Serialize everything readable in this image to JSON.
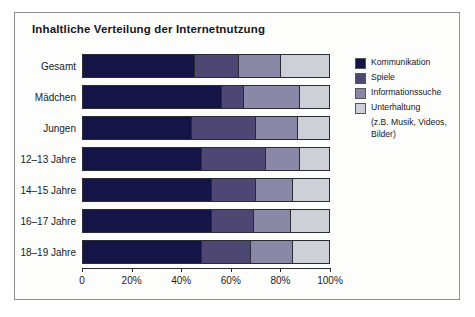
{
  "title": "Inhaltliche Verteilung der Internetnutzung",
  "legend": {
    "items": [
      {
        "label": "Kommunikation",
        "color": "#141446"
      },
      {
        "label": "Spiele",
        "color": "#4e4673"
      },
      {
        "label": "Informationssuche",
        "color": "#8a88a6"
      },
      {
        "label": "Unterhaltung",
        "color": "#cfcfd8"
      }
    ],
    "sublines": [
      "(z.B. Musik, Videos,",
      "Bilder)"
    ]
  },
  "axis": {
    "ticks": [
      "0",
      "20%",
      "40%",
      "60%",
      "80%",
      "100%"
    ],
    "tick_values": [
      0,
      20,
      40,
      60,
      80,
      100
    ]
  },
  "chart_data": {
    "type": "bar",
    "orientation": "horizontal",
    "stacked": true,
    "title": "Inhaltliche Verteilung der Internetnutzung",
    "xlabel": "",
    "ylabel": "",
    "xlim": [
      0,
      100
    ],
    "grid": false,
    "legend_position": "right",
    "categories": [
      "Gesamt",
      "Mädchen",
      "Jungen",
      "12–13 Jahre",
      "14–15 Jahre",
      "16–17 Jahre",
      "18–19 Jahre"
    ],
    "series": [
      {
        "name": "Kommunikation",
        "color": "#141446",
        "values": [
          45,
          56,
          44,
          48,
          52,
          52,
          48
        ]
      },
      {
        "name": "Spiele",
        "color": "#4e4673",
        "values": [
          18,
          9,
          26,
          26,
          18,
          17,
          20
        ]
      },
      {
        "name": "Informationssuche",
        "color": "#8a88a6",
        "values": [
          17,
          23,
          17,
          14,
          15,
          15,
          17
        ]
      },
      {
        "name": "Unterhaltung",
        "color": "#cfcfd8",
        "values": [
          20,
          12,
          13,
          12,
          15,
          16,
          15
        ]
      }
    ]
  }
}
